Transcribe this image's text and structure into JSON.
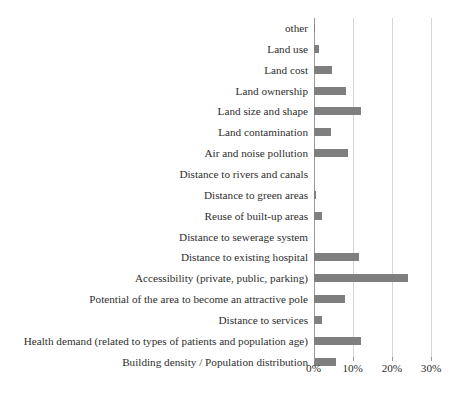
{
  "chart_data": {
    "type": "bar",
    "orientation": "horizontal",
    "title": "",
    "subtitle": "",
    "xlabel": "",
    "ylabel": "",
    "xlim": [
      0,
      30
    ],
    "xtick_labels": [
      "0%",
      "10%",
      "20%",
      "30%"
    ],
    "xticks": [
      0,
      10,
      20,
      30
    ],
    "grid": "vertical",
    "legend": "none",
    "bar_color": "#7f7f7f",
    "gridline_color": "#d6d6d6",
    "axis_color": "#9a9a9a",
    "units": "percent",
    "categories": [
      "other",
      "Land use",
      "Land cost",
      "Land ownership",
      "Land size and shape",
      "Land contamination",
      "Air and noise pollution",
      "Distance to rivers and canals",
      "Distance to green areas",
      "Reuse of built-up areas",
      "Distance to sewerage system",
      "Distance to existing hospital",
      "Accessibility (private, public, parking)",
      "Potential of the area to become an attractive pole",
      "Distance to services",
      "Health demand (related to types of patients and population age)",
      "Building density / Population distribution"
    ],
    "values": [
      0.4,
      1.3,
      4.7,
      8.3,
      12.0,
      4.4,
      8.8,
      0.0,
      0.7,
      2.2,
      0.0,
      11.5,
      24.0,
      8.0,
      2.2,
      12.2,
      5.8
    ]
  }
}
